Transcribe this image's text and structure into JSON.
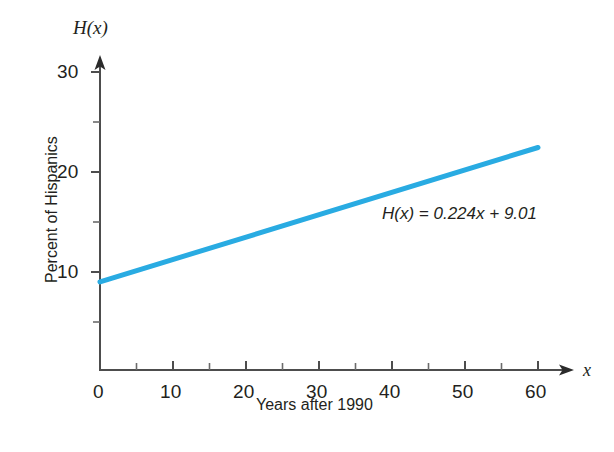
{
  "chart_data": {
    "type": "line",
    "title": "",
    "xlabel": "Years after 1990",
    "ylabel": "Percent of Hispanics",
    "x_axis_variable": "x",
    "y_axis_variable": "H(x)",
    "xlim": [
      0,
      64
    ],
    "ylim": [
      0,
      32
    ],
    "x_ticks_major": [
      0,
      10,
      20,
      30,
      40,
      50,
      60
    ],
    "x_tick_labels": [
      "0",
      "10",
      "20",
      "30",
      "40",
      "50",
      "60"
    ],
    "x_ticks_minor": [
      5,
      15,
      25,
      35,
      45,
      55
    ],
    "y_ticks_major": [
      10,
      20,
      30
    ],
    "y_tick_labels": [
      "10",
      "20",
      "30"
    ],
    "y_ticks_minor": [
      5,
      15,
      25
    ],
    "grid": false,
    "legend": false,
    "annotation": "H(x) = 0.224x + 9.01",
    "annotation_x": 24,
    "annotation_y": 15.7,
    "series": [
      {
        "name": "H(x) = 0.224x + 9.01",
        "color": "#29abe2",
        "line_width": 5,
        "slope": 0.224,
        "intercept": 9.01,
        "x": [
          0,
          60
        ],
        "values": [
          9.01,
          22.45
        ],
        "points": [
          {
            "x": 0,
            "y": 9.01
          },
          {
            "x": 10,
            "y": 11.25
          },
          {
            "x": 20,
            "y": 13.49
          },
          {
            "x": 30,
            "y": 15.73
          },
          {
            "x": 40,
            "y": 17.97
          },
          {
            "x": 50,
            "y": 20.21
          },
          {
            "x": 60,
            "y": 22.45
          }
        ]
      }
    ]
  },
  "colors": {
    "line": "#29abe2",
    "axis": "#4d4d4d",
    "text": "#231f20",
    "background": "#ffffff"
  }
}
